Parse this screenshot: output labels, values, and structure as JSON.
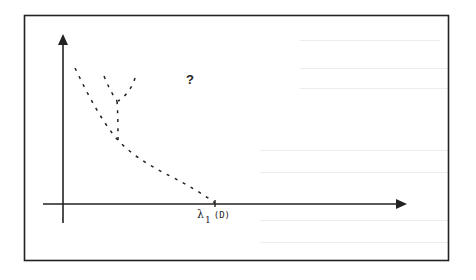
{
  "figure": {
    "question_mark": "?",
    "x_axis_label": {
      "symbol": "λ",
      "subscript": "1",
      "argument": "(D)"
    },
    "colors": {
      "ink": "#222222",
      "background": "#ffffff"
    },
    "elements": {
      "frame": "rectangle border",
      "y_axis": "vertical arrow",
      "x_axis": "horizontal arrow",
      "curves": [
        "dashed curve descending to λ1(D)",
        "dashed Y-shaped branch"
      ]
    }
  }
}
